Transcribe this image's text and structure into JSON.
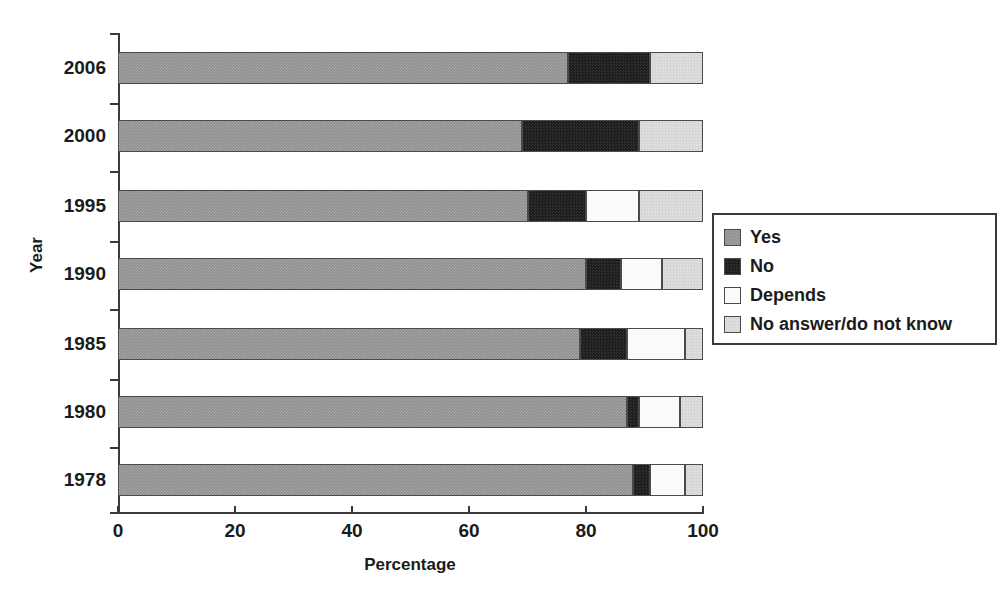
{
  "chart_data": {
    "type": "bar",
    "orientation": "horizontal",
    "stacked": true,
    "title": "",
    "xlabel": "Percentage",
    "ylabel": "Year",
    "xlim": [
      0,
      100
    ],
    "xticks": [
      0,
      20,
      40,
      60,
      80,
      100
    ],
    "xtick_labels": [
      "0",
      "20",
      "40",
      "60",
      "80",
      "100"
    ],
    "grid": false,
    "legend_position": "right",
    "categories": [
      "1978",
      "1980",
      "1985",
      "1990",
      "1995",
      "2000",
      "2006"
    ],
    "category_order_top_to_bottom": [
      "2006",
      "2000",
      "1995",
      "1990",
      "1985",
      "1980",
      "1978"
    ],
    "series": [
      {
        "name": "Yes",
        "color": "#8d8d8d",
        "values": [
          77,
          69,
          70,
          80,
          79,
          87,
          88
        ]
      },
      {
        "name": "No",
        "color": "#1e1e1e",
        "values": [
          91,
          89,
          80,
          86,
          87,
          89,
          91
        ]
      },
      {
        "name": "Depends",
        "color": "#fbfbfb",
        "values": [
          0,
          0,
          89,
          93,
          97,
          96,
          97
        ]
      },
      {
        "name": "No answer/do not know",
        "color": "#d6d6d6",
        "values": [
          100,
          100,
          100,
          100,
          100,
          100,
          100
        ]
      }
    ],
    "segments": [
      {
        "year": "2006",
        "Yes": 88,
        "No": 3,
        "Depends": 6,
        "NoAnswer": 3
      },
      {
        "year": "2000",
        "Yes": 87,
        "No": 2,
        "Depends": 7,
        "NoAnswer": 4
      },
      {
        "year": "1995",
        "Yes": 79,
        "No": 8,
        "Depends": 10,
        "NoAnswer": 3
      },
      {
        "year": "1990",
        "Yes": 80,
        "No": 6,
        "Depends": 7,
        "NoAnswer": 7
      },
      {
        "year": "1985",
        "Yes": 70,
        "No": 10,
        "Depends": 9,
        "NoAnswer": 11
      },
      {
        "year": "1980",
        "Yes": 69,
        "No": 20,
        "Depends": 0,
        "NoAnswer": 11
      },
      {
        "year": "1978",
        "Yes": 77,
        "No": 14,
        "Depends": 0,
        "NoAnswer": 9
      }
    ]
  },
  "axes": {
    "x_title": "Percentage",
    "y_title": "Year",
    "x_ticks": [
      {
        "value": 0,
        "label": "0"
      },
      {
        "value": 20,
        "label": "20"
      },
      {
        "value": 40,
        "label": "40"
      },
      {
        "value": 60,
        "label": "60"
      },
      {
        "value": 80,
        "label": "80"
      },
      {
        "value": 100,
        "label": "100"
      }
    ],
    "y_ticks": [
      {
        "label": "2006"
      },
      {
        "label": "2000"
      },
      {
        "label": "1995"
      },
      {
        "label": "1990"
      },
      {
        "label": "1985"
      },
      {
        "label": "1980"
      },
      {
        "label": "1978"
      }
    ]
  },
  "legend": {
    "items": [
      {
        "label": "Yes",
        "color": "#8d8d8d"
      },
      {
        "label": "No",
        "color": "#1e1e1e"
      },
      {
        "label": "Depends",
        "color": "#fbfbfb"
      },
      {
        "label": "No answer/do not know",
        "color": "#d6d6d6"
      }
    ]
  }
}
